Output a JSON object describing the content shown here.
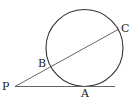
{
  "diagram": {
    "labels": {
      "P": "P",
      "A": "A",
      "B": "B",
      "C": "C"
    },
    "stroke_color": "#333333",
    "circle": {
      "cx": 84.5,
      "cy": 48,
      "r": 39
    },
    "points": {
      "P": {
        "x": 15,
        "y": 86
      },
      "A": {
        "x": 84.5,
        "y": 86
      },
      "B": {
        "x": 49,
        "y": 65
      },
      "C": {
        "x": 119,
        "y": 29
      }
    }
  }
}
